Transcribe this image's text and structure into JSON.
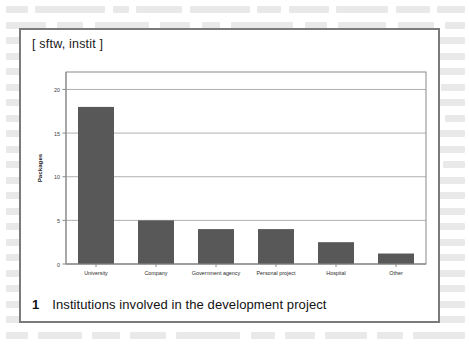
{
  "figure": {
    "tag_label": "[ sftw, instit ]",
    "caption_number": "1",
    "caption_text": "Institutions involved in the development project",
    "frame_color": "#7b7b7b"
  },
  "chart_data": {
    "type": "bar",
    "title": "",
    "subtitle": "",
    "xlabel": "",
    "ylabel": "Packages",
    "categories": [
      "University",
      "Company",
      "Government agency",
      "Personal project",
      "Hospital",
      "Other"
    ],
    "values": [
      18,
      5,
      4,
      4,
      2.5,
      1.2
    ],
    "series": [
      {
        "name": "Packages",
        "values": [
          18,
          5,
          4,
          4,
          2.5,
          1.2
        ]
      }
    ],
    "ylim": [
      0,
      22
    ],
    "yticks": [
      0,
      5,
      10,
      15,
      20
    ],
    "ytick_labels": [
      "0",
      "5",
      "10",
      "15",
      "20"
    ],
    "grid": true,
    "grid_axis": "y",
    "legend": false,
    "legend_position": "none",
    "bar_color": "#585858",
    "axis_color": "#8a8a8a",
    "grid_color": "#9a9a9a",
    "plot_background": "#ffffff"
  }
}
